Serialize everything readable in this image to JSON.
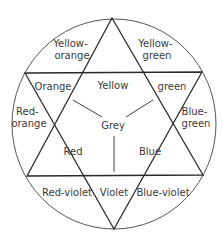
{
  "diagram": {
    "type": "color-wheel",
    "center": "Grey",
    "primaries": [
      "Yellow",
      "Red",
      "Blue"
    ],
    "secondaries": [
      "Orange",
      "green",
      "Violet"
    ],
    "tertiaries": [
      [
        "Yellow-",
        "orange"
      ],
      [
        "Yellow-",
        "green"
      ],
      [
        "Red-",
        "orange"
      ],
      [
        "Blue-",
        "green"
      ],
      [
        "Red-violet"
      ],
      [
        "Blue-violet"
      ]
    ]
  },
  "labels": {
    "yellow": "Yellow",
    "red": "Red",
    "blue": "Blue",
    "grey": "Grey",
    "orange": "Orange",
    "green": "green",
    "violet": "Violet",
    "yellow_orange_1": "Yellow-",
    "yellow_orange_2": "orange",
    "yellow_green_1": "Yellow-",
    "yellow_green_2": "green",
    "red_orange_1": "Red-",
    "red_orange_2": "orange",
    "blue_green_1": "Blue-",
    "blue_green_2": "green",
    "red_violet": "Red-violet",
    "blue_violet": "Blue-violet"
  }
}
